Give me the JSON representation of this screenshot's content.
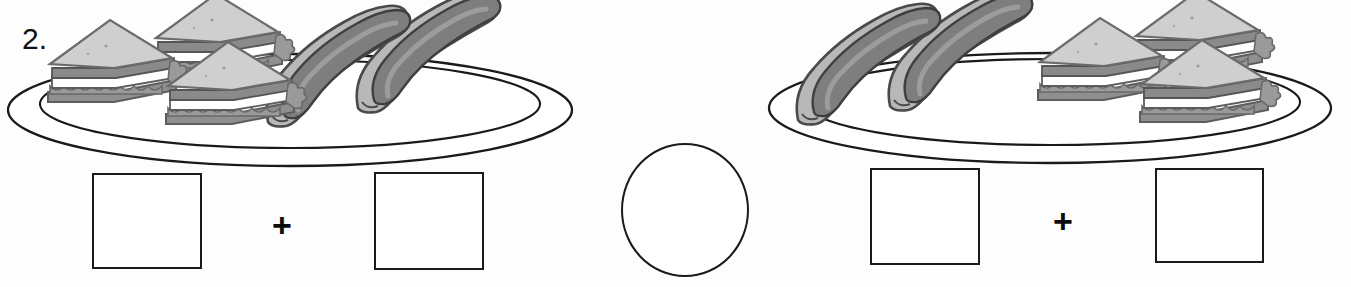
{
  "worksheet": {
    "problem_number": "2.",
    "plus_symbol": "+",
    "item_types": [
      "sandwich",
      "hot-dog"
    ],
    "answer_box_value": "",
    "compare_circle_value": ""
  },
  "left_group": {
    "label": "left-plate-group",
    "plate": {
      "name": "oval-plate",
      "rim": true
    },
    "sandwiches": {
      "count": 3,
      "label": "sandwich"
    },
    "hotdogs": {
      "count": 2,
      "label": "hot-dog"
    },
    "box_1_value": "",
    "box_2_value": "",
    "operator": "+"
  },
  "right_group": {
    "label": "right-plate-group",
    "plate": {
      "name": "oval-plate",
      "rim": true
    },
    "sandwiches": {
      "count": 3,
      "label": "sandwich"
    },
    "hotdogs": {
      "count": 2,
      "label": "hot-dog"
    },
    "box_1_value": "",
    "box_2_value": "",
    "operator": "+"
  },
  "colors": {
    "outline": "#1a1a1a",
    "bread": "#c9c9c9",
    "bread_edge": "#8a8a8a",
    "filling_dark": "#8f8f8f",
    "filling_light": "#ffffff",
    "bun": "#b5b5b5",
    "sausage": "#8a8a8a",
    "paper": "#fdfdfd"
  }
}
